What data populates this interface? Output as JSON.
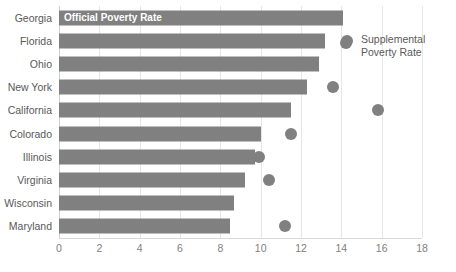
{
  "chart": {
    "type": "bar",
    "title": "",
    "cropped_title": "",
    "xlabel": "",
    "ylabel": "",
    "xlim": [
      0,
      18
    ],
    "xticks": [
      0,
      2,
      4,
      6,
      8,
      10,
      12,
      14,
      16,
      18
    ],
    "grid": "vertical",
    "bar_color": "#808080",
    "dot_color": "#808080",
    "legend_position": "top-right-inside",
    "inline_bar_label": "Official Poverty Rate",
    "legend": [
      {
        "label": "Supplemental Poverty Rate",
        "marker": "circle"
      }
    ]
  },
  "chart_data": {
    "type": "bar",
    "title": "",
    "xlabel": "",
    "ylabel": "",
    "xlim": [
      0,
      18
    ],
    "xticks": [
      0,
      2,
      4,
      6,
      8,
      10,
      12,
      14,
      16,
      18
    ],
    "grid": true,
    "orientation": "horizontal",
    "legend_position": "top-right",
    "categories": [
      "Georgia",
      "Florida",
      "Ohio",
      "New York",
      "California",
      "Colorado",
      "Illinois",
      "Virginia",
      "Wisconsin",
      "Maryland"
    ],
    "series": [
      {
        "name": "Official Poverty Rate",
        "type": "bar",
        "values": [
          14.1,
          13.2,
          12.9,
          12.3,
          11.5,
          10.0,
          9.7,
          9.2,
          8.7,
          8.5
        ]
      },
      {
        "name": "Supplemental Poverty Rate",
        "type": "scatter",
        "values": [
          12.5,
          14.3,
          12.5,
          13.6,
          15.8,
          11.5,
          9.9,
          10.4,
          8.4,
          11.2
        ]
      }
    ]
  },
  "axis": {
    "tick_labels": [
      "0",
      "2",
      "4",
      "6",
      "8",
      "10",
      "12",
      "14",
      "16",
      "18"
    ]
  },
  "rows": [
    {
      "label": "Georgia",
      "bar": 14.1,
      "dot": 12.5
    },
    {
      "label": "Florida",
      "bar": 13.2,
      "dot": 14.3
    },
    {
      "label": "Ohio",
      "bar": 12.9,
      "dot": 12.5
    },
    {
      "label": "New York",
      "bar": 12.3,
      "dot": 13.6
    },
    {
      "label": "California",
      "bar": 11.5,
      "dot": 15.8
    },
    {
      "label": "Colorado",
      "bar": 10.0,
      "dot": 11.5
    },
    {
      "label": "Illinois",
      "bar": 9.7,
      "dot": 9.9
    },
    {
      "label": "Virginia",
      "bar": 9.2,
      "dot": 10.4
    },
    {
      "label": "Wisconsin",
      "bar": 8.7,
      "dot": 8.4
    },
    {
      "label": "Maryland",
      "bar": 8.5,
      "dot": 11.2
    }
  ],
  "legend": {
    "supplemental_line1": "Supplemental",
    "supplemental_line2": "Poverty Rate"
  },
  "inline": {
    "official_label": "Official Poverty Rate"
  }
}
